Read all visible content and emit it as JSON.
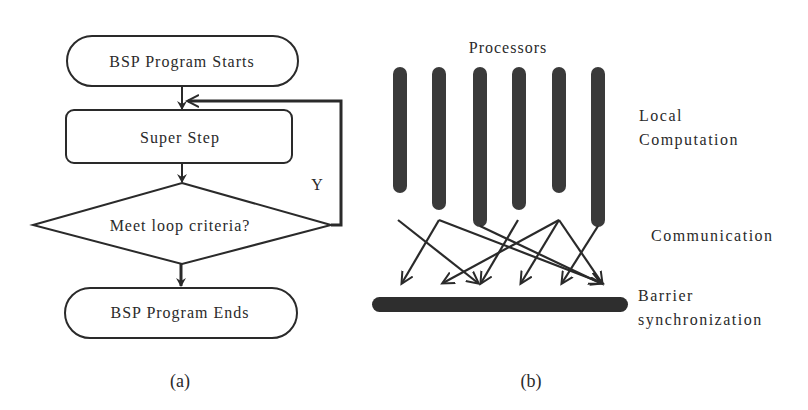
{
  "panel_a": {
    "caption": "(a)",
    "start_label": "BSP Program Starts",
    "superstep_label": "Super Step",
    "decision_label": "Meet loop criteria?",
    "loop_label": "Y",
    "end_label": "BSP Program Ends"
  },
  "panel_b": {
    "caption": "(b)",
    "processors_label": "Processors",
    "phase_local_line1": "Local",
    "phase_local_line2": "Computation",
    "phase_communication": "Communication",
    "phase_barrier_line1": "Barrier",
    "phase_barrier_line2": "synchronization",
    "processor_count": 6
  },
  "colors": {
    "ink": "#2a2a2a",
    "bar": "#3a3a3a",
    "background": "#ffffff"
  }
}
